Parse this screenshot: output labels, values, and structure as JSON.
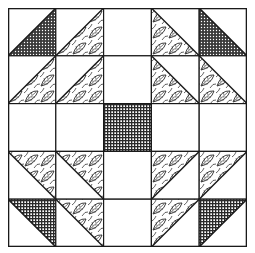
{
  "quilt": {
    "grid_size": 5,
    "colors": {
      "line": "#1a1a1a",
      "background": "#ffffff",
      "dark": "#2a2a2a"
    },
    "cells": [
      [
        {
          "fill": "dots",
          "tri": "br"
        },
        {
          "fill": "leaf",
          "tri": "br"
        },
        {
          "fill": "none",
          "tri": "none"
        },
        {
          "fill": "leaf",
          "tri": "bl"
        },
        {
          "fill": "dots",
          "tri": "bl"
        }
      ],
      [
        {
          "fill": "leaf",
          "tri": "br"
        },
        {
          "fill": "leaf",
          "tri": "br"
        },
        {
          "fill": "none",
          "tri": "none"
        },
        {
          "fill": "leaf",
          "tri": "bl"
        },
        {
          "fill": "leaf",
          "tri": "bl"
        }
      ],
      [
        {
          "fill": "none",
          "tri": "none"
        },
        {
          "fill": "none",
          "tri": "none"
        },
        {
          "fill": "grid",
          "tri": "full"
        },
        {
          "fill": "none",
          "tri": "none"
        },
        {
          "fill": "none",
          "tri": "none"
        }
      ],
      [
        {
          "fill": "leaf",
          "tri": "tr"
        },
        {
          "fill": "leaf",
          "tri": "tr"
        },
        {
          "fill": "none",
          "tri": "none"
        },
        {
          "fill": "leaf",
          "tri": "tl"
        },
        {
          "fill": "leaf",
          "tri": "tl"
        }
      ],
      [
        {
          "fill": "grid",
          "tri": "tr"
        },
        {
          "fill": "leaf",
          "tri": "tr"
        },
        {
          "fill": "none",
          "tri": "none"
        },
        {
          "fill": "leaf",
          "tri": "tl"
        },
        {
          "fill": "grid",
          "tri": "tl"
        }
      ]
    ]
  }
}
